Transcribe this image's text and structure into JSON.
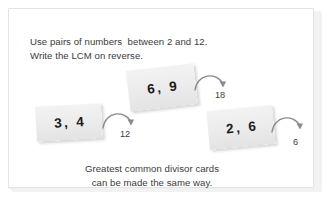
{
  "poster": {
    "intro_line1": "Use pairs of numbers  between 2 and 12.",
    "intro_line2": "Write the LCM on reverse.",
    "footer_line1": "Greatest common divisor cards",
    "footer_line2": "can be made the same way.",
    "cards": [
      {
        "id": "card-3-4",
        "label": "3,  4",
        "result": "12",
        "arrow_icon": "curved-arrow-right-icon"
      },
      {
        "id": "card-6-9",
        "label": "6,  9",
        "result": "18",
        "arrow_icon": "curved-arrow-right-icon"
      },
      {
        "id": "card-2-6",
        "label": "2,  6",
        "result": "6",
        "arrow_icon": "curved-arrow-right-icon"
      }
    ],
    "colors": {
      "page_background": "#ffffff",
      "panel_background": "#ffffff",
      "panel_border": "#e4e4e4",
      "card_face": "#ececec",
      "card_text": "#1b1b1b",
      "body_text": "#3b3b3b",
      "arrow_stroke": "#7d7d7d"
    }
  }
}
